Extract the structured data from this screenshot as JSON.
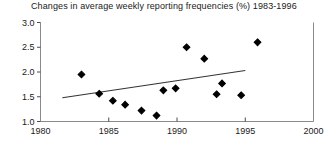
{
  "chart_data": {
    "type": "scatter",
    "title": "Changes in average weekly reporting frequencies (%) 1983-1996",
    "xlabel": "",
    "ylabel": "",
    "xlim": [
      1980,
      2000
    ],
    "ylim": [
      1.0,
      3.0
    ],
    "xticks": [
      1980,
      1985,
      1990,
      1995,
      2000
    ],
    "xtick_labels": [
      "1980",
      "1985",
      "1990",
      "1995",
      "2000"
    ],
    "yticks": [
      1.0,
      1.5,
      2.0,
      2.5,
      3.0
    ],
    "ytick_labels": [
      "1.0",
      "1.5",
      "2.0",
      "2.5",
      "3.0"
    ],
    "grid": false,
    "legend": null,
    "marker": "diamond",
    "marker_color": "#000000",
    "points": [
      {
        "x": 1983.0,
        "y": 1.95
      },
      {
        "x": 1984.3,
        "y": 1.56
      },
      {
        "x": 1985.3,
        "y": 1.42
      },
      {
        "x": 1986.2,
        "y": 1.34
      },
      {
        "x": 1987.4,
        "y": 1.22
      },
      {
        "x": 1988.5,
        "y": 1.12
      },
      {
        "x": 1989.0,
        "y": 1.63
      },
      {
        "x": 1989.9,
        "y": 1.67
      },
      {
        "x": 1990.7,
        "y": 2.5
      },
      {
        "x": 1992.0,
        "y": 2.27
      },
      {
        "x": 1992.9,
        "y": 1.55
      },
      {
        "x": 1993.3,
        "y": 1.77
      },
      {
        "x": 1994.7,
        "y": 1.53
      },
      {
        "x": 1995.9,
        "y": 2.6
      }
    ],
    "trendline": {
      "x0": 1981.6,
      "y0": 1.48,
      "x1": 1995.0,
      "y1": 2.03,
      "color": "#333333"
    }
  }
}
